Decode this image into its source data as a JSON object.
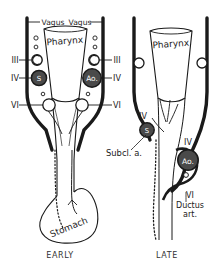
{
  "figure": {
    "title_hidden": "",
    "ink_color": "#1a1a1a",
    "fill_dark": "#4a4a4a",
    "fill_light": "#ffffff",
    "paper": "#ffffff"
  },
  "panels": [
    {
      "key": "early",
      "caption": "EARLY",
      "structures": {
        "pharynx": "Pharynx",
        "stomach": "Stomach",
        "vagus_left": "Vagus",
        "vagus_right": "Vagus"
      },
      "arch_labels_left": [
        "III",
        "IV",
        "VI"
      ],
      "arch_labels_right": [
        "III",
        "IV",
        "VI"
      ],
      "vessel_discs": [
        {
          "label": "S",
          "side": "left",
          "shade": "dark"
        },
        {
          "label": "Ao.",
          "side": "right",
          "shade": "dark"
        }
      ]
    },
    {
      "key": "late",
      "caption": "LATE",
      "structures": {
        "pharynx": "Pharynx",
        "subclavian": "Subcl. a.",
        "ductus_numeral": "VI",
        "ductus_line1": "Ductus",
        "ductus_line2": "art."
      },
      "arch_labels": [
        "IV",
        "IV"
      ],
      "vessel_discs": [
        {
          "label": "S",
          "side": "left",
          "shade": "dark"
        },
        {
          "label": "Ao.",
          "side": "right",
          "shade": "dark"
        }
      ]
    }
  ],
  "legend_text": {
    "numeral_three": "III",
    "numeral_four": "IV",
    "numeral_six": "VI"
  }
}
